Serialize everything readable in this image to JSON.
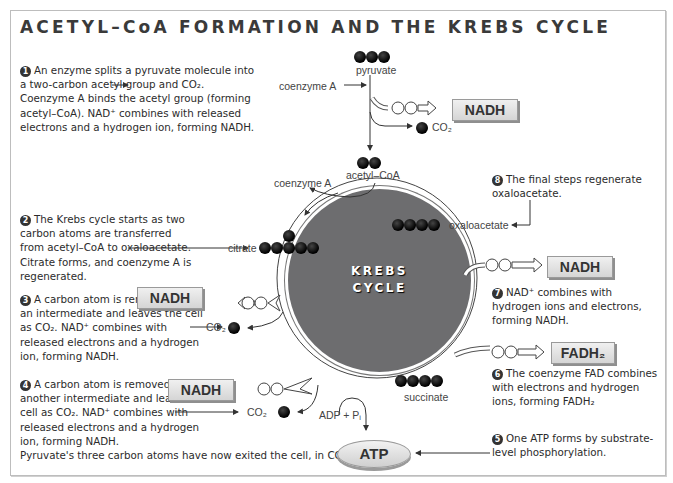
{
  "title": "ACETYL–CoA FORMATION AND THE KREBS CYCLE",
  "steps": {
    "s1": {
      "num": "1",
      "text": "An enzyme splits a pyruvate molecule into a two-carbon acetyl group and CO₂. Coenzyme A binds the acetyl group (forming acetyl–CoA). NAD⁺ combines with released electrons and a hydrogen ion, forming NADH."
    },
    "s2": {
      "num": "2",
      "text": "The Krebs cycle starts as two carbon atoms are transferred from acetyl–CoA to oxaloacetate. Citrate forms, and coenzyme A is regenerated."
    },
    "s3": {
      "num": "3",
      "text": "A carbon atom is removed from an intermediate and leaves the cell as CO₂. NAD⁺ combines with released electrons and a hydrogen ion, forming NADH."
    },
    "s4": {
      "num": "4",
      "text": "A carbon atom is removed from another intermediate and leaves the cell as CO₂. NAD⁺ combines with released electrons and a hydrogen ion, forming NADH.",
      "extra": "Pyruvate's three carbon atoms have now exited the cell, in CO₂."
    },
    "s5": {
      "num": "5",
      "text": "One ATP forms by substrate-level phosphorylation."
    },
    "s6": {
      "num": "6",
      "text": "The coenzyme FAD combines with electrons and hydrogen ions, forming FADH₂"
    },
    "s7": {
      "num": "7",
      "text": "NAD⁺ combines with hydrogen ions and electrons, forming NADH."
    },
    "s8": {
      "num": "8",
      "text": "The final steps regenerate oxaloacetate."
    }
  },
  "labels": {
    "pyruvate": "pyruvate",
    "coenzyme_a_in": "coenzyme A",
    "coenzyme_a_out": "coenzyme A",
    "acetyl_coa": "acetyl–CoA",
    "co2_top": "CO₂",
    "citrate": "citrate",
    "oxaloacetate": "oxaloacetate",
    "co2_3": "CO₂",
    "co2_4": "CO₂",
    "succinate": "succinate",
    "adp_pi": "ADP + Pᵢ",
    "electron": "e⁻"
  },
  "boxes": {
    "nadh_1": "NADH",
    "nadh_3": "NADH",
    "nadh_4": "NADH",
    "nadh_7": "NADH",
    "fadh2_6": "FADH₂",
    "atp": "ATP"
  },
  "cycle": {
    "line1": "KREBS",
    "line2": "CYCLE",
    "color": "#6d6d6f"
  }
}
